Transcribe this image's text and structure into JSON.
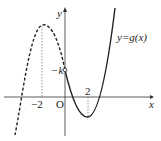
{
  "diagram": {
    "axes": {
      "x_label": "x",
      "y_label": "y",
      "origin_label": "O"
    },
    "curve_label": "y=g(x)",
    "tick_labels": {
      "neg_two": "−2",
      "two": "2",
      "neg_k": "−k"
    },
    "notes": {
      "dashed_part": "x < 0",
      "solid_part": "x ≥ 0",
      "open_point": "(0, −k)",
      "local_max_x": -2,
      "local_min_x": 2
    }
  }
}
